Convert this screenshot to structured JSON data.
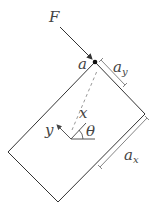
{
  "diagram": {
    "title": "",
    "labels": {
      "force": "F",
      "point": "a",
      "dim_y": "a",
      "dim_y_sub": "y",
      "dim_x": "a",
      "dim_x_sub": "x",
      "axis_x": "x",
      "axis_y": "y",
      "angle": "θ"
    },
    "colors": {
      "stroke": "#333333",
      "dim_stroke": "#666666",
      "dashed": "#999999",
      "text": "#444444"
    }
  }
}
